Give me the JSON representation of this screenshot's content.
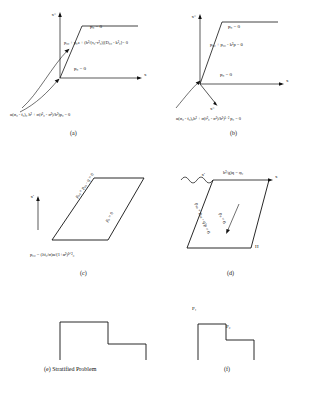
{
  "figure": {
    "panels": [
      {
        "id": "a",
        "caption": "(a)",
        "axis_labels": {
          "vertical": "x°",
          "horizontal": "x"
        },
        "annotations": [
          "p₀ = 0",
          "p₀₀ + p₀z + (h²/(τ₀-τ²₀))[D₀₀ - k²₀]= 0",
          "p₀ = 0",
          "α(σ₀ - f₀)₀ h² + σ(f²₀ - σ²)/h²)p₀ = 0"
        ]
      },
      {
        "id": "b",
        "caption": "(b)",
        "axis_labels": {
          "vertical": "x°",
          "horizontal": "x"
        },
        "annotations": [
          "p₀ = 0",
          "p₀₀ + p₀₀ - k²p = 0",
          "p₀ = 0",
          "α(σ₀ - f₀)₀h² + σ(f²₀ - σ²)/h²)¹ᐟ² p₀ = 0"
        ]
      },
      {
        "id": "c",
        "caption": "(c)",
        "axis_labels": {
          "vertical": "x'",
          "horizontal": ""
        },
        "annotations": [
          "p₀₀ + p₀₀ - q = 0",
          "p₀ = 0",
          "p₀₀ = (λf₀/σ)α/(1+α²)¹ᐟ²₀"
        ]
      },
      {
        "id": "d",
        "caption": "(d)",
        "axis_labels": {
          "vertical": "x'",
          "horizontal": "x"
        },
        "annotations": [
          "h²/g)q = φ₀",
          "p₀₀ + p₀₀ - q²p = 0",
          "p₀ = 0",
          "H"
        ]
      },
      {
        "id": "e",
        "caption": "(e)  Stratified Problem",
        "axis_labels": {},
        "annotations": []
      },
      {
        "id": "f",
        "caption": "(f)",
        "axis_labels": {},
        "annotations": [
          "P₁",
          "P₂"
        ]
      }
    ]
  },
  "colors": {
    "ink": "#111111",
    "background": "#ffffff"
  }
}
